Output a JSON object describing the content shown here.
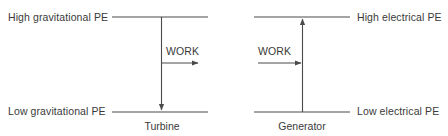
{
  "figure": {
    "background_color": "#ffffff",
    "line_color": "#4a4a4a",
    "text_color": "#3a3a3a"
  },
  "diagrams": [
    {
      "id": "turbine",
      "device_label": "Generator placeholder",
      "high_level_label": "High gravitational PE",
      "low_level_label": "Low gravitational PE",
      "work_label": "WORK",
      "caption": "Turbine",
      "flow_direction": "down",
      "work_direction": "right-out"
    },
    {
      "id": "generator",
      "high_level_label": "High electrical PE",
      "low_level_label": "Low electrical PE",
      "work_label": "WORK",
      "caption": "Generator",
      "flow_direction": "up",
      "work_direction": "right-in"
    }
  ],
  "labels": {
    "high_gravitational_pe": "High gravitational PE",
    "low_gravitational_pe": "Low gravitational PE",
    "high_electrical_pe": "High electrical PE",
    "low_electrical_pe": "Low electrical PE",
    "work_turbine": "WORK",
    "work_generator": "WORK",
    "turbine": "Turbine",
    "generator": "Generator"
  }
}
